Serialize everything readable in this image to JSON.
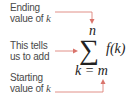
{
  "annotations": [
    {
      "id": "ending",
      "line1": "Ending",
      "line2_text": "value of ",
      "line2_var": "k"
    },
    {
      "id": "add",
      "line1": "This tells",
      "line2_text": "us to add"
    },
    {
      "id": "starting",
      "line1": "Starting",
      "line2_text": "value of ",
      "line2_var": "k"
    }
  ],
  "formula": {
    "upper_limit": "n",
    "operator": "∑",
    "summand": "f(k)",
    "lower_limit": "k = m"
  },
  "colors": {
    "arrow": "#d9736b",
    "text": "#4a4a4a",
    "math": "#222222"
  }
}
